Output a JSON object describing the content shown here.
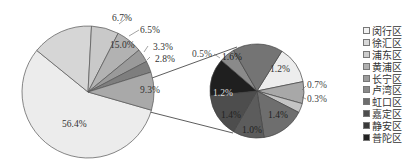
{
  "chart_data": {
    "type": "pie",
    "title": "",
    "main_pie": {
      "slices": [
        {
          "label": "56.4%",
          "value": 56.4,
          "color": "#ececec"
        },
        {
          "label": "15.0%",
          "value": 15.0,
          "color": "#d6d6d6"
        },
        {
          "label": "6.7%",
          "value": 6.7,
          "color": "#c9c9c9"
        },
        {
          "label": "6.5%",
          "value": 6.5,
          "color": "#b2b2b2"
        },
        {
          "label": "3.3%",
          "value": 3.3,
          "color": "#9a9a9a"
        },
        {
          "label": "2.8%",
          "value": 2.8,
          "color": "#7e7e7e"
        },
        {
          "label": "9.3%",
          "value": 9.3,
          "color": "#a9a9a9",
          "exploded_to_sub_pie": true
        }
      ]
    },
    "sub_pie": {
      "slices": [
        {
          "label": "1.2%",
          "value": 1.2,
          "color": "#ededed"
        },
        {
          "label": "0.7%",
          "value": 0.7,
          "color": "#a8a8a8"
        },
        {
          "label": "0.3%",
          "value": 0.3,
          "color": "#c4c4c4"
        },
        {
          "label": "1.4%",
          "value": 1.4,
          "color": "#6e6e6e"
        },
        {
          "label": "1.0%",
          "value": 1.0,
          "color": "#5c5c5c"
        },
        {
          "label": "1.4%",
          "value": 1.4,
          "color": "#4d4d4d"
        },
        {
          "label": "1.2%",
          "value": 1.2,
          "color": "#1f1f1f"
        },
        {
          "label": "0.5%",
          "value": 0.5,
          "color": "#8a8a8a"
        },
        {
          "label": "1.6%",
          "value": 1.6,
          "color": "#747474"
        }
      ]
    },
    "legend": {
      "placement": "right",
      "entries": [
        {
          "name": "闵行区",
          "color": "#f2f2f2"
        },
        {
          "name": "徐汇区",
          "color": "#d9d9d9"
        },
        {
          "name": "浦东区",
          "color": "#cccccc"
        },
        {
          "name": "黄浦区",
          "color": "#b0b0b0"
        },
        {
          "name": "长宁区",
          "color": "#9c9c9c"
        },
        {
          "name": "卢湾区",
          "color": "#8a8a8a"
        },
        {
          "name": "虹口区",
          "color": "#6e6e6e"
        },
        {
          "name": "嘉定区",
          "color": "#4d4d4d"
        },
        {
          "name": "静安区",
          "color": "#3a3a3a"
        },
        {
          "name": "普陀区",
          "color": "#222222"
        }
      ]
    }
  }
}
